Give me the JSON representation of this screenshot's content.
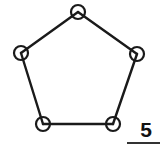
{
  "figure": {
    "background_color": "#ffffff",
    "stroke_color": "#1a1a1a",
    "canvas": {
      "width": 160,
      "height": 149
    }
  },
  "graph": {
    "node_radius": 7,
    "node_count": 5,
    "edge_count": 5,
    "nodes": [
      {
        "id": "n1",
        "name": "node-top",
        "cx": 78,
        "cy": 12
      },
      {
        "id": "n2",
        "name": "node-right",
        "cx": 137,
        "cy": 54
      },
      {
        "id": "n3",
        "name": "node-bottom-right",
        "cx": 113,
        "cy": 124
      },
      {
        "id": "n4",
        "name": "node-bottom-left",
        "cx": 43,
        "cy": 124
      },
      {
        "id": "n5",
        "name": "node-left",
        "cx": 21,
        "cy": 53
      }
    ],
    "edges": [
      {
        "id": "e1",
        "name": "edge-top-right",
        "x1": 78,
        "y1": 12,
        "x2": 137,
        "y2": 54
      },
      {
        "id": "e2",
        "name": "edge-right-bottom-right",
        "x1": 137,
        "y1": 54,
        "x2": 113,
        "y2": 124
      },
      {
        "id": "e3",
        "name": "edge-bottom",
        "x1": 113,
        "y1": 124,
        "x2": 43,
        "y2": 124
      },
      {
        "id": "e4",
        "name": "edge-bottom-left-left",
        "x1": 43,
        "y1": 124,
        "x2": 21,
        "y2": 53
      },
      {
        "id": "e5",
        "name": "edge-left-top",
        "x1": 21,
        "y1": 53,
        "x2": 78,
        "y2": 12
      }
    ]
  },
  "scale": {
    "value": "5",
    "rule_color": "#333333"
  }
}
